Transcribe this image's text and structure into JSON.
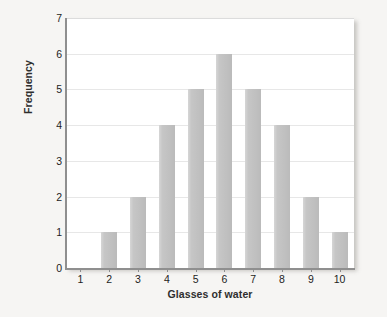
{
  "chart_data": {
    "type": "bar",
    "title": "",
    "xlabel": "Glasses of water",
    "ylabel": "Frequency",
    "categories": [
      "1",
      "2",
      "3",
      "4",
      "5",
      "6",
      "7",
      "8",
      "9",
      "10"
    ],
    "values": [
      0,
      1,
      2,
      4,
      5,
      6,
      5,
      4,
      2,
      1
    ],
    "yticks": [
      "0",
      "1",
      "2",
      "3",
      "4",
      "5",
      "6",
      "7"
    ],
    "ylim": [
      0,
      7
    ],
    "grid": "horizontal",
    "legend": "none",
    "series": [
      {
        "name": "Frequency",
        "values": [
          0,
          1,
          2,
          4,
          5,
          6,
          5,
          4,
          2,
          1
        ]
      }
    ]
  },
  "colors": {
    "bar_fill": "#c4c4c4",
    "plot_background": "#ffffff",
    "page_background": "#f6f5f3",
    "gridline": "#e7e7e7",
    "axis_line": "#8f8f8f",
    "tick_text": "#1d1d1d",
    "axis_title_text": "#2e2e2e"
  }
}
